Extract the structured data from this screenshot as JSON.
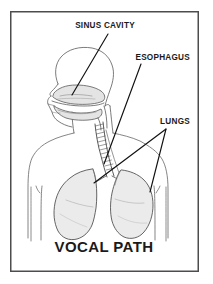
{
  "figure": {
    "name": "vocal-path-anatomical-diagram",
    "title": "VOCAL PATH",
    "frame": {
      "border_color": "#4d4d4d",
      "border_width_px": 1.5,
      "background_color": "#ffffff",
      "x": 10,
      "y": 11,
      "width": 189,
      "height": 261
    },
    "style": {
      "line_color": "#333333",
      "outline_color": "#555555",
      "organ_fill": "#ebebeb",
      "cavity_fill": "#e4e4e4",
      "leader_color": "#111111",
      "text_color": "#1a1a1a"
    },
    "labels": [
      {
        "id": "sinus-cavity",
        "text": "SINUS CAVITY",
        "text_x": 105,
        "text_y": 28,
        "anchor": "middle",
        "leaders": [
          {
            "x1": 108,
            "y1": 34,
            "x2": 72,
            "y2": 95
          }
        ]
      },
      {
        "id": "esophagus",
        "text": "ESOPHAGUS",
        "text_x": 190,
        "text_y": 60,
        "anchor": "end",
        "leaders": [
          {
            "x1": 141,
            "y1": 64,
            "x2": 104,
            "y2": 164
          }
        ]
      },
      {
        "id": "lungs",
        "text": "LUNGS",
        "text_x": 190,
        "text_y": 124,
        "anchor": "end",
        "leaders": [
          {
            "x1": 166,
            "y1": 129,
            "x2": 94,
            "y2": 183
          },
          {
            "x1": 166,
            "y1": 129,
            "x2": 150,
            "y2": 192
          }
        ]
      }
    ],
    "title_position": {
      "x": 104,
      "y": 252,
      "anchor": "middle"
    },
    "anatomy_parts": [
      {
        "id": "skull-cranium",
        "label": "skull / cranium outline"
      },
      {
        "id": "nasal-sinus-cavity",
        "label": "nasal sinus cavity"
      },
      {
        "id": "oral-cavity-tongue",
        "label": "oral cavity and tongue"
      },
      {
        "id": "jaw-chin-profile",
        "label": "jaw and chin profile"
      },
      {
        "id": "trachea",
        "label": "trachea with cartilage rings"
      },
      {
        "id": "esophagus-tube",
        "label": "esophagus tube"
      },
      {
        "id": "left-lung",
        "label": "left lung"
      },
      {
        "id": "right-lung",
        "label": "right lung"
      },
      {
        "id": "torso-shoulders",
        "label": "torso and shoulders outline"
      },
      {
        "id": "neck",
        "label": "neck outline"
      }
    ]
  }
}
